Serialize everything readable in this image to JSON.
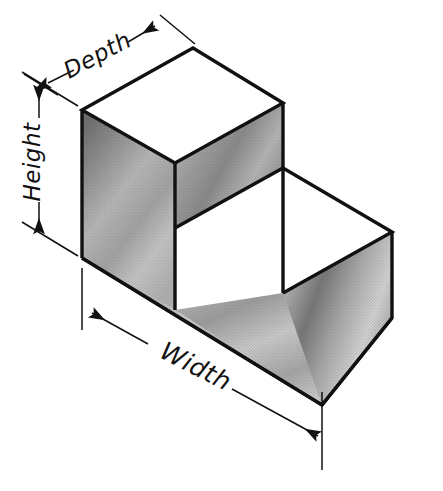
{
  "figure": {
    "background_color": "#ffffff",
    "line_color": "#111111",
    "labels": {
      "depth": "Depth",
      "height": "Height",
      "width": "Width"
    }
  },
  "dimensions": [
    {
      "name": "depth",
      "label": "Depth",
      "orientation": "receding-axis",
      "arrowheads": "both-ends",
      "label_rotation_deg": -28,
      "line": {
        "x1": 48,
        "y1": 83,
        "x2": 155,
        "y2": 26
      },
      "label_position": {
        "x": 100,
        "y": 58
      }
    },
    {
      "name": "height",
      "label": "Height",
      "orientation": "vertical",
      "arrowheads": "both-ends",
      "label_rotation_deg": -90,
      "line": {
        "x1": 39,
        "y1": 86,
        "x2": 39,
        "y2": 231
      },
      "label_position": {
        "x": 39,
        "y": 160
      }
    },
    {
      "name": "width",
      "label": "Width",
      "orientation": "horizontal-axis",
      "arrowheads": "both-ends",
      "label_rotation_deg": 27,
      "line": {
        "x1": 92,
        "y1": 313,
        "x2": 320,
        "y2": 438
      },
      "label_position": {
        "x": 196,
        "y": 370
      }
    }
  ],
  "solid": {
    "shape": "L-shaped stepped block",
    "faces": [
      {
        "name": "upper-top-face",
        "shading": "white",
        "fill": "#ffffff"
      },
      {
        "name": "upper-right-face",
        "shading": "gradient-gray",
        "fill": "#a8a8a8"
      },
      {
        "name": "step-riser-face",
        "shading": "gradient-gray",
        "fill": "#9a9a9a"
      },
      {
        "name": "lower-top-face",
        "shading": "white",
        "fill": "#ffffff"
      },
      {
        "name": "left-side-face",
        "shading": "gradient-gray",
        "fill": "#b0b0b0"
      },
      {
        "name": "front-long-face",
        "shading": "gradient-gray",
        "fill": "#b4b4b4"
      },
      {
        "name": "right-end-face",
        "shading": "gradient-gray",
        "fill": "#9c9c9c"
      }
    ],
    "vertices": {
      "top_left": [
        82,
        110
      ],
      "top_back": [
        193,
        48
      ],
      "top_right": [
        283,
        103
      ],
      "step_inner_top": [
        175,
        163
      ],
      "step_inner_bottom": [
        175,
        228
      ],
      "upper_right_lower": [
        283,
        168
      ],
      "lower_back_right": [
        392,
        232
      ],
      "lower_front": [
        283,
        293
      ],
      "bottom_left": [
        82,
        258
      ],
      "bottom_front_left": [
        175,
        310
      ],
      "bottom_right": [
        392,
        318
      ],
      "bottom_front": [
        322,
        405
      ]
    }
  }
}
